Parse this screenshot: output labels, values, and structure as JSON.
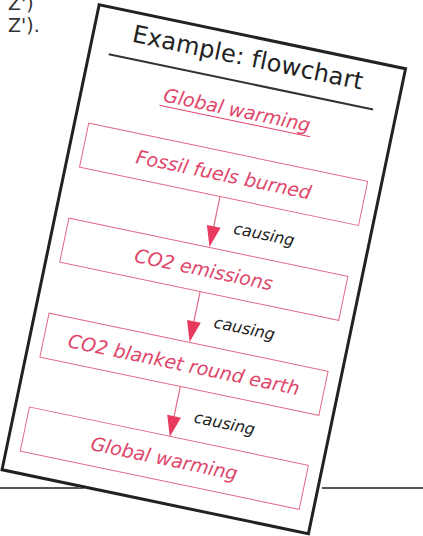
{
  "margin_text": [
    "Z')",
    "Z')."
  ],
  "card": {
    "title": "Example: flowchart",
    "subtitle": "Global warming",
    "steps": [
      "Fossil fuels burned",
      "CO2 emissions",
      "CO2 blanket round earth",
      "Global warming"
    ],
    "connector_label": "causing",
    "connectors": [
      "causing",
      "causing",
      "causing"
    ]
  },
  "colors": {
    "accent": "#e0456a",
    "box_border": "#e26a86",
    "ink": "#222222"
  }
}
